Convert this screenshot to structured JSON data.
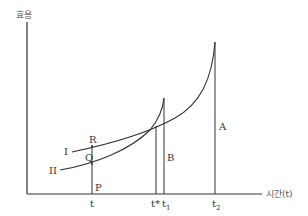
{
  "diagram": {
    "y_axis_label": "효용",
    "x_axis_label": "시간(t)",
    "curves": [
      {
        "name": "I",
        "label": "I"
      },
      {
        "name": "II",
        "label": "II"
      }
    ],
    "points": {
      "R": "R",
      "Q": "Q",
      "P": "P"
    },
    "segments": {
      "A": "A",
      "B": "B"
    },
    "x_ticks": [
      "t",
      "t*",
      "t1",
      "t2"
    ],
    "tick_t": "t",
    "tick_tstar": "t*",
    "tick_t1_base": "t",
    "tick_t1_sub": "1",
    "tick_t2_base": "t",
    "tick_t2_sub": "2",
    "colors": {
      "line": "#333333",
      "text": "#333333"
    }
  }
}
